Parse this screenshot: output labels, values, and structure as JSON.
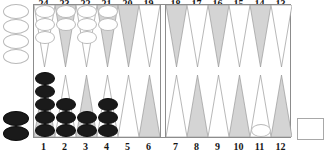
{
  "board": {
    "type": "backgammon-board",
    "colors": {
      "point_light": "#ffffff",
      "point_dark": "#d4d4d4",
      "point_outline": "#9a9a9a",
      "checker_white": "#ffffff",
      "checker_white_outline": "#b9b9b9",
      "checker_black": "#1a1a1a",
      "board_border": "#8c8c8c",
      "label_text": "#151515"
    },
    "labels": {
      "top_left": [
        "24",
        "23",
        "22",
        "21",
        "20",
        "19"
      ],
      "top_right": [
        "18",
        "17",
        "16",
        "15",
        "14",
        "13"
      ],
      "bottom_left": [
        "1",
        "2",
        "3",
        "4",
        "5",
        "6"
      ],
      "bottom_right": [
        "7",
        "8",
        "9",
        "10",
        "11",
        "12"
      ]
    },
    "quadrants": {
      "top_left": [
        {
          "point": "24",
          "shade": "light",
          "color": "white",
          "count": 3
        },
        {
          "point": "23",
          "shade": "dark",
          "color": "white",
          "count": 2
        },
        {
          "point": "22",
          "shade": "light",
          "color": "white",
          "count": 3
        },
        {
          "point": "21",
          "shade": "dark",
          "color": "white",
          "count": 2
        },
        {
          "point": "20",
          "shade": "dark",
          "color": "none",
          "count": 0
        },
        {
          "point": "19",
          "shade": "light",
          "color": "none",
          "count": 0
        }
      ],
      "top_right": [
        {
          "point": "18",
          "shade": "dark",
          "color": "none",
          "count": 0
        },
        {
          "point": "17",
          "shade": "light",
          "color": "none",
          "count": 0
        },
        {
          "point": "16",
          "shade": "dark",
          "color": "none",
          "count": 0
        },
        {
          "point": "15",
          "shade": "light",
          "color": "none",
          "count": 0
        },
        {
          "point": "14",
          "shade": "dark",
          "color": "none",
          "count": 0
        },
        {
          "point": "13",
          "shade": "light",
          "color": "none",
          "count": 0
        }
      ],
      "bottom_left": [
        {
          "point": "1",
          "shade": "dark",
          "color": "black",
          "count": 5
        },
        {
          "point": "2",
          "shade": "light",
          "color": "black",
          "count": 3
        },
        {
          "point": "3",
          "shade": "dark",
          "color": "black",
          "count": 2
        },
        {
          "point": "4",
          "shade": "light",
          "color": "black",
          "count": 3
        },
        {
          "point": "5",
          "shade": "light",
          "color": "none",
          "count": 0
        },
        {
          "point": "6",
          "shade": "dark",
          "color": "none",
          "count": 0
        }
      ],
      "bottom_right": [
        {
          "point": "7",
          "shade": "light",
          "color": "none",
          "count": 0
        },
        {
          "point": "8",
          "shade": "dark",
          "color": "none",
          "count": 0
        },
        {
          "point": "9",
          "shade": "light",
          "color": "none",
          "count": 0
        },
        {
          "point": "10",
          "shade": "dark",
          "color": "none",
          "count": 0
        },
        {
          "point": "11",
          "shade": "light",
          "color": "white",
          "count": 1
        },
        {
          "point": "12",
          "shade": "dark",
          "color": "none",
          "count": 0
        }
      ]
    },
    "trays": {
      "white_off": {
        "color": "white",
        "count": 4
      },
      "black_off": {
        "color": "black",
        "count": 2
      }
    },
    "side_box": {
      "label": ""
    }
  }
}
